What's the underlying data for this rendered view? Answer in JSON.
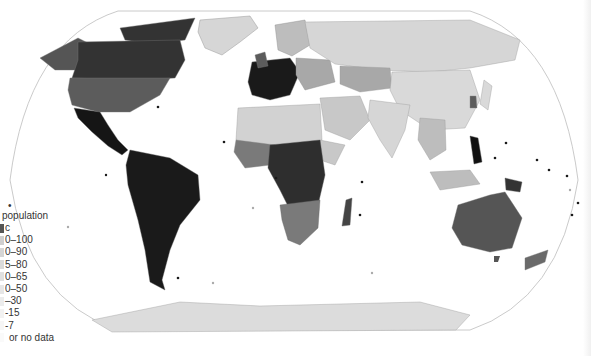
{
  "map": {
    "type": "choropleth",
    "projection": "robinson",
    "theme": "Catholic population share by country (percent)",
    "colors": {
      "ocean": "#ffffff",
      "outline": "#bdbdbd",
      "border": "#9a9a9a"
    }
  },
  "legend": {
    "marker": "•",
    "title": "population",
    "subtitle": "c",
    "items": [
      {
        "label": "0–100",
        "color": "#1e1e1e"
      },
      {
        "label": "0–90",
        "color": "#333333"
      },
      {
        "label": "5–80",
        "color": "#4a4a4a"
      },
      {
        "label": "0–65",
        "color": "#646464"
      },
      {
        "label": "0–50",
        "color": "#7d7d7d"
      },
      {
        "label": "–30",
        "color": "#9a9a9a"
      },
      {
        "label": "-15",
        "color": "#b5b5b5"
      },
      {
        "label": "-7",
        "color": "#cfcfcf"
      },
      {
        "label": "or no data",
        "color": "#e2e2e2"
      }
    ]
  },
  "regions": [
    {
      "name": "Greenland",
      "shade": "#d6d6d6"
    },
    {
      "name": "Canada",
      "shade": "#333333"
    },
    {
      "name": "Alaska",
      "shade": "#555555"
    },
    {
      "name": "United States",
      "shade": "#5c5c5c"
    },
    {
      "name": "Mexico",
      "shade": "#151515"
    },
    {
      "name": "South America",
      "shade": "#1a1a1a"
    },
    {
      "name": "Western Europe",
      "shade": "#1a1a1a"
    },
    {
      "name": "Scandinavia",
      "shade": "#bdbdbd"
    },
    {
      "name": "Russia",
      "shade": "#d6d6d6"
    },
    {
      "name": "Kazakhstan",
      "shade": "#a8a8a8"
    },
    {
      "name": "China",
      "shade": "#d9d9d9"
    },
    {
      "name": "India",
      "shade": "#d6d6d6"
    },
    {
      "name": "Middle East",
      "shade": "#c8c8c8"
    },
    {
      "name": "North Africa",
      "shade": "#d2d2d2"
    },
    {
      "name": "Central Africa",
      "shade": "#2e2e2e"
    },
    {
      "name": "Southern Africa",
      "shade": "#7a7a7a"
    },
    {
      "name": "Madagascar",
      "shade": "#444444"
    },
    {
      "name": "Philippines",
      "shade": "#111111"
    },
    {
      "name": "Australia",
      "shade": "#555555"
    },
    {
      "name": "New Zealand",
      "shade": "#6a6a6a"
    },
    {
      "name": "Papua New Guinea",
      "shade": "#333333"
    },
    {
      "name": "Indonesia",
      "shade": "#bdbdbd"
    },
    {
      "name": "Antarctica",
      "shade": "#dcdcdc"
    }
  ]
}
